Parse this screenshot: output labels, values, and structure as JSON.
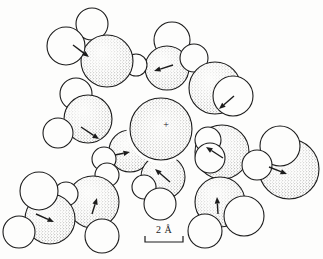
{
  "figure": {
    "kind": "space-filling-molecular-diagram",
    "canvas": {
      "width": 323,
      "height": 259
    },
    "colors": {
      "ink": "#1c1c1c",
      "paper": "#fdfdfc",
      "stipple_dot": "#2b2b2b"
    },
    "ion": {
      "symbol": "+",
      "cx": 161,
      "cy": 129,
      "r": 31,
      "halo_r": 34.5,
      "symbol_x": 166,
      "symbol_y": 125
    },
    "scale_bar": {
      "label": "2 Å",
      "x1": 145,
      "x2": 183,
      "y": 242,
      "tick_height": 6,
      "label_x": 164,
      "label_y": 233
    },
    "molecules": [
      {
        "id": "w2",
        "layer": "back",
        "o": [
          167,
          68,
          22
        ],
        "h": [
          [
            172,
            40,
            18,
            0
          ],
          [
            136,
            65,
            11,
            1
          ]
        ],
        "arrow": [
          173,
          65,
          154,
          71
        ]
      },
      {
        "id": "w3",
        "layer": "back",
        "o": [
          215,
          88,
          26
        ],
        "h": [
          [
            194,
            58,
            14,
            0
          ],
          [
            233,
            96,
            20,
            1
          ]
        ],
        "arrow": [
          234,
          96,
          219,
          109
        ]
      },
      {
        "id": "w1",
        "layer": "back",
        "o": [
          107,
          61,
          26
        ],
        "h": [
          [
            92,
            24,
            16,
            0
          ],
          [
            66,
            46,
            19,
            1
          ]
        ],
        "arrow": [
          73,
          45,
          89,
          57
        ]
      },
      {
        "id": "w4",
        "layer": "back",
        "o": [
          88,
          119,
          24
        ],
        "h": [
          [
            76,
            94,
            16,
            0
          ],
          [
            58,
            133,
            15,
            1
          ]
        ],
        "arrow": [
          81,
          127,
          99,
          139
        ]
      },
      {
        "id": "w5",
        "layer": "back",
        "o": [
          222,
          152,
          27
        ],
        "h": [
          [
            208,
            140,
            13,
            1
          ],
          [
            210,
            158,
            15,
            1
          ]
        ],
        "arrow": [
          223,
          158,
          206,
          147
        ]
      },
      {
        "id": "w6",
        "layer": "back",
        "o": [
          289,
          169,
          30
        ],
        "h": [
          [
            280,
            146,
            20,
            1
          ],
          [
            257,
            165,
            15,
            1
          ]
        ],
        "arrow": [
          269,
          167,
          287,
          174
        ]
      },
      {
        "id": "w7",
        "layer": "back",
        "o": [
          130,
          151,
          21
        ],
        "h": [
          [
            104,
            159,
            12,
            1
          ],
          [
            107,
            175,
            12,
            1
          ]
        ],
        "arrow": [
          115,
          155,
          130,
          152
        ]
      },
      {
        "id": "w8",
        "layer": "back",
        "o": [
          163,
          177,
          22
        ],
        "h": [
          [
            144,
            187,
            12,
            1
          ],
          [
            160,
            204,
            16,
            1
          ]
        ],
        "arrow": [
          170,
          182,
          155,
          169
        ]
      },
      {
        "id": "w9",
        "layer": "front",
        "o": [
          93,
          202,
          26
        ],
        "h": [
          [
            66,
            194,
            12,
            1
          ],
          [
            102,
            236,
            17,
            1
          ]
        ],
        "arrow": [
          92,
          214,
          97,
          198
        ]
      },
      {
        "id": "w10",
        "layer": "front",
        "o": [
          50,
          219,
          25
        ],
        "h": [
          [
            39,
            191,
            19,
            1
          ],
          [
            19,
            232,
            16,
            1
          ]
        ],
        "arrow": [
          36,
          214,
          54,
          222
        ]
      },
      {
        "id": "w11",
        "layer": "front",
        "o": [
          220,
          202,
          25
        ],
        "h": [
          [
            205,
            231,
            17,
            1
          ],
          [
            244,
            216,
            20,
            1
          ]
        ],
        "arrow": [
          218,
          214,
          217,
          197
        ]
      }
    ]
  }
}
